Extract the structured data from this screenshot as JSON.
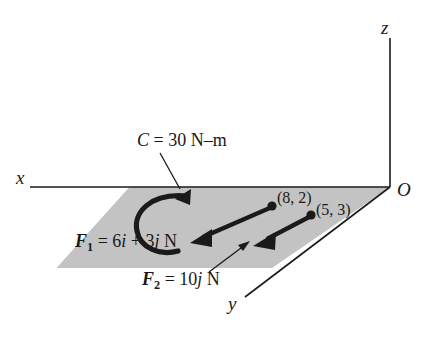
{
  "figure": {
    "type": "free-body-diagram",
    "background_color": "#ffffff",
    "plane_fill_color": "#c3c3c3",
    "line_color": "#1a1a1a"
  },
  "axes": {
    "x_label": "x",
    "y_label": "y",
    "z_label": "z",
    "origin_label": "O"
  },
  "couple": {
    "label_C": "C",
    "label_equals": " = 30 N–m",
    "full": "C = 30 N–m",
    "magnitude": 30,
    "units": "N–m",
    "sense": "counterclockwise-arc"
  },
  "forces": [
    {
      "name_symbol": "F",
      "name_subscript": "1",
      "expression": " = 6i + 3j N",
      "full": "F1 = 6i + 3j N",
      "components": {
        "i": 6,
        "j": 3
      },
      "units": "N",
      "point_label": "(8, 2)",
      "point": [
        8,
        2
      ]
    },
    {
      "name_symbol": "F",
      "name_subscript": "2",
      "expression": " = 10j N",
      "full": "F2 = 10j N",
      "components": {
        "i": 0,
        "j": 10
      },
      "units": "N",
      "point_label": "(5, 3)",
      "point": [
        5,
        3
      ]
    }
  ],
  "force_label_parts": {
    "f1_symbol": "F",
    "f1_sub": "1",
    "f1_eq": " = 6",
    "f1_i": "i",
    "f1_plus": " + 3",
    "f1_j": "j",
    "f1_units": " N",
    "f2_symbol": "F",
    "f2_sub": "2",
    "f2_eq": " = 10",
    "f2_j": "j",
    "f2_units": " N"
  },
  "points": {
    "p1": "(8, 2)",
    "p2": "(5, 3)"
  },
  "caption": {
    "text": ""
  }
}
